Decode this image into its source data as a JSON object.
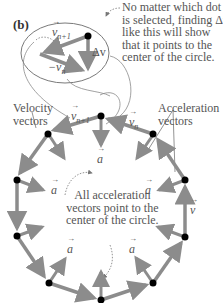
{
  "panel_label": "(b)",
  "inset": {
    "v_next_label": "v",
    "v_next_sub": "n+1",
    "neg_v_label": "−v",
    "neg_v_sub": "n",
    "delta_v_label": "Δv"
  },
  "callout_top": {
    "lines": [
      "No matter which dot",
      "is selected, finding Δv",
      "like this will show",
      "that it points to the",
      "center of the circle."
    ]
  },
  "velocity_label": [
    "Velocity",
    "vectors"
  ],
  "acceleration_label": [
    "Acceleration",
    "vectors"
  ],
  "center_note": [
    "All acceleration",
    "vectors point to the",
    "center of the circle."
  ],
  "polygon_labels": {
    "v_next": "v",
    "v_next_sub": "n+1",
    "v_n": "v",
    "v_n_sub": "n",
    "v_right": "v",
    "a": "a"
  },
  "colors": {
    "arrow": "#8c8c8c",
    "dot": "#000000",
    "text": "#555555",
    "ellipse": "#7a7a7a"
  }
}
